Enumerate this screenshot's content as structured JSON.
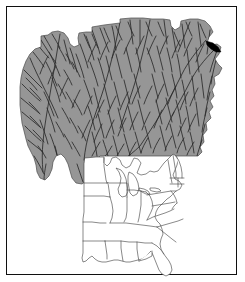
{
  "figure": {
    "kind": "map-figure",
    "frame_border_color": "#101010",
    "background_color": "#ffffff",
    "title": "",
    "caption": "",
    "labels": [],
    "legend": []
  },
  "main_map": {
    "name": "watershed-basin-map",
    "fill_color": "#969696",
    "outline_color": "#4a4a4a",
    "river_color": "#2b2b2b",
    "marker_color": "#000000",
    "marker_label": "",
    "description_not_rendered": "",
    "bounds_px": {
      "x": 14,
      "y": 14,
      "width": 215,
      "height": 172
    }
  },
  "inset_map": {
    "name": "eastern-us-locator-map",
    "fill_color": "#ffffff",
    "outline_color": "#3a3a3a",
    "bounds_px": {
      "x": 82,
      "y": 152,
      "width": 120,
      "height": 122
    },
    "regions": [
      "Minnesota",
      "Iowa",
      "Missouri",
      "Arkansas",
      "Louisiana",
      "Wisconsin",
      "Illinois",
      "Michigan",
      "Indiana",
      "Ohio",
      "Kentucky",
      "Tennessee",
      "Mississippi",
      "Alabama",
      "Georgia",
      "Florida",
      "South Carolina",
      "North Carolina",
      "Virginia",
      "West Virginia",
      "Maryland",
      "Delaware",
      "Pennsylvania",
      "New Jersey",
      "New York",
      "Connecticut",
      "Rhode Island",
      "Massachusetts",
      "Vermont",
      "New Hampshire",
      "Maine"
    ]
  }
}
